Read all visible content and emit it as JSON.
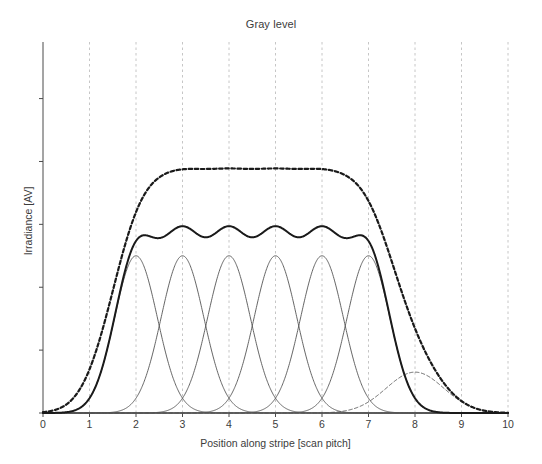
{
  "chart_data": {
    "type": "line",
    "title": "Gray level",
    "xlabel": "Position along stripe [scan pitch]",
    "ylabel": "Irradiance [AV]",
    "xlim": [
      0,
      10
    ],
    "ylim": [
      0,
      1.18
    ],
    "xticks": [
      0,
      1,
      2,
      3,
      4,
      5,
      6,
      7,
      8,
      9,
      10
    ],
    "xticklabels": [
      "0",
      "1",
      "2",
      "3",
      "4",
      "5",
      "6",
      "7",
      "8",
      "9",
      "10"
    ],
    "yticks": [
      0,
      0.2,
      0.4,
      0.6,
      0.8,
      1.0
    ],
    "yticklabels": [
      "",
      "",
      "",
      "",
      "",
      ""
    ],
    "grid": "vertical dashed light gray",
    "legend": "none",
    "series": [
      {
        "name": "gaussian-spot-1",
        "style": "solid-thin",
        "color": "#555555",
        "type": "gaussian",
        "center": 2.0,
        "amplitude": 0.5,
        "sigma": 0.46
      },
      {
        "name": "gaussian-spot-2",
        "style": "solid-thin",
        "color": "#555555",
        "type": "gaussian",
        "center": 3.0,
        "amplitude": 0.5,
        "sigma": 0.46
      },
      {
        "name": "gaussian-spot-3",
        "style": "solid-thin",
        "color": "#555555",
        "type": "gaussian",
        "center": 4.0,
        "amplitude": 0.5,
        "sigma": 0.46
      },
      {
        "name": "gaussian-spot-4",
        "style": "solid-thin",
        "color": "#555555",
        "type": "gaussian",
        "center": 5.0,
        "amplitude": 0.5,
        "sigma": 0.46
      },
      {
        "name": "gaussian-spot-5",
        "style": "solid-thin",
        "color": "#555555",
        "type": "gaussian",
        "center": 6.0,
        "amplitude": 0.5,
        "sigma": 0.46
      },
      {
        "name": "gaussian-spot-6",
        "style": "solid-thin",
        "color": "#555555",
        "type": "gaussian",
        "center": 7.0,
        "amplitude": 0.5,
        "sigma": 0.46
      },
      {
        "name": "gaussian-spot-extra-dashed",
        "style": "dashed-thin",
        "color": "#555555",
        "type": "gaussian",
        "center": 8.0,
        "amplitude": 0.13,
        "sigma": 0.62
      },
      {
        "name": "sum-profile-solid",
        "style": "solid-thick",
        "color": "#1a1a1a",
        "type": "sum",
        "components": [
          2,
          3,
          4,
          5,
          6,
          7
        ],
        "amplitude": 0.5,
        "sigma": 0.46
      },
      {
        "name": "sum-profile-dashed",
        "style": "dashed-thick",
        "color": "#1a1a1a",
        "type": "sum",
        "components": [
          2,
          3,
          4,
          5,
          6,
          7,
          8
        ],
        "amplitudes": [
          0.5,
          0.5,
          0.5,
          0.5,
          0.5,
          0.5,
          0.13
        ],
        "sigma": 0.46,
        "extra_sigma": 0.62
      }
    ]
  },
  "axes": {
    "plot_left_px": 43,
    "plot_right_px": 508,
    "plot_top_px": 42,
    "plot_bottom_px": 413
  }
}
